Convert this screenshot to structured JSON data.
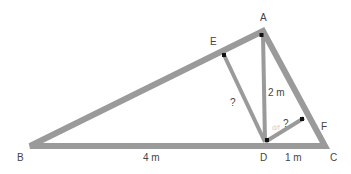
{
  "diagram": {
    "points": {
      "A": "A",
      "B": "B",
      "C": "C",
      "D": "D",
      "E": "E",
      "F": "F"
    },
    "measures": {
      "BD": "4 m",
      "AD": "2 m",
      "DC": "1 m",
      "DE": "?",
      "DF": "?",
      "DF_faint": "d/f"
    },
    "colors": {
      "stroke": "#9a9a9a",
      "right_angle": "#111111",
      "text": "#444444"
    }
  }
}
